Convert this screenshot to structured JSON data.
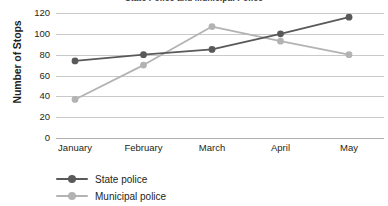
{
  "chart_data": {
    "type": "line",
    "title": "State Police and Municipal Police",
    "xlabel": "",
    "ylabel": "Number of Stops",
    "categories": [
      "January",
      "February",
      "March",
      "April",
      "May"
    ],
    "series": [
      {
        "name": "State police",
        "color": "#595959",
        "values": [
          74,
          80,
          85,
          100,
          116
        ]
      },
      {
        "name": "Municipal police",
        "color": "#b3b3b3",
        "values": [
          37,
          70,
          107,
          93,
          80
        ]
      }
    ],
    "ylim": [
      0,
      120
    ],
    "yticks": [
      0,
      20,
      40,
      60,
      80,
      100,
      120
    ],
    "ytick_labels": [
      "0",
      "20",
      "40",
      "60",
      "80",
      "100",
      "120"
    ],
    "grid": true,
    "legend_position": "bottom-left",
    "marker": "circle"
  },
  "colors": {
    "grid": "#c9c9c9",
    "text": "#231f20",
    "background": "#ffffff"
  }
}
